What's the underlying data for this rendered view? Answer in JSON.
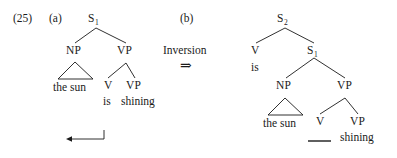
{
  "figure": {
    "example_number": "(25)",
    "background_color": "#ffffff",
    "ink_color": "#1a1a1a",
    "caption_a": "(a)",
    "caption_b": "(b)",
    "operation": {
      "name": "Inversion",
      "arrow": "⇒"
    }
  },
  "tree_a": {
    "root": "S",
    "root_subscript": "1",
    "nodes": {
      "np": "NP",
      "vp": "VP",
      "v": "V",
      "vp_inner": "VP"
    },
    "words": {
      "subject": "the sun",
      "aux": "is",
      "verb": "shining"
    },
    "movement_arrow_label": "movement-arrow-leftward"
  },
  "tree_b": {
    "root": "S",
    "root_subscript": "2",
    "nodes": {
      "v": "V",
      "s1": "S",
      "s1_subscript": "1",
      "np": "NP",
      "vp": "VP",
      "v_inner": "V",
      "vp_inner": "VP"
    },
    "words": {
      "aux": "is",
      "subject": "the sun",
      "trace": "    ",
      "verb": "shining"
    }
  }
}
